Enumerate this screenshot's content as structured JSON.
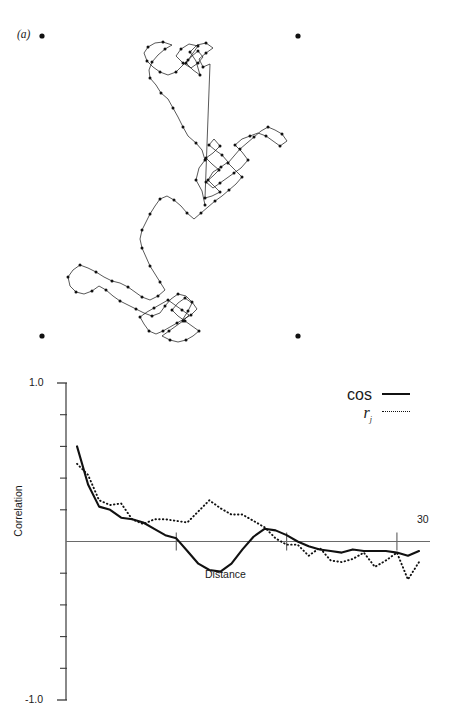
{
  "panels": {
    "a": {
      "label": "(a)"
    },
    "b": {
      "label": "(b)"
    }
  },
  "panel_a": {
    "name": "random-walk-trajectory",
    "corner_markers": [
      {
        "x": 42,
        "y": 36
      },
      {
        "x": 298,
        "y": 36
      },
      {
        "x": 42,
        "y": 336
      },
      {
        "x": 298,
        "y": 336
      }
    ],
    "marker_radius": 2.6,
    "vertex_radius": 1.5,
    "line_color": "#111111",
    "path": [
      [
        205,
        205
      ],
      [
        202,
        191
      ],
      [
        196,
        180
      ],
      [
        199,
        168
      ],
      [
        205,
        160
      ],
      [
        202,
        150
      ],
      [
        196,
        143
      ],
      [
        188,
        136
      ],
      [
        183,
        127
      ],
      [
        178,
        117
      ],
      [
        173,
        108
      ],
      [
        168,
        99
      ],
      [
        161,
        93
      ],
      [
        156,
        85
      ],
      [
        150,
        78
      ],
      [
        149,
        70
      ],
      [
        152,
        62
      ],
      [
        158,
        55
      ],
      [
        165,
        49
      ],
      [
        172,
        45
      ],
      [
        163,
        42
      ],
      [
        155,
        43
      ],
      [
        148,
        47
      ],
      [
        144,
        53
      ],
      [
        147,
        61
      ],
      [
        153,
        67
      ],
      [
        160,
        72
      ],
      [
        168,
        75
      ],
      [
        176,
        72
      ],
      [
        182,
        66
      ],
      [
        188,
        60
      ],
      [
        193,
        53
      ],
      [
        198,
        46
      ],
      [
        189,
        44
      ],
      [
        181,
        49
      ],
      [
        176,
        56
      ],
      [
        183,
        63
      ],
      [
        191,
        68
      ],
      [
        198,
        63
      ],
      [
        203,
        57
      ],
      [
        198,
        51
      ],
      [
        192,
        56
      ],
      [
        186,
        63
      ],
      [
        193,
        70
      ],
      [
        200,
        75
      ],
      [
        196,
        61
      ],
      [
        190,
        52
      ],
      [
        197,
        45
      ],
      [
        206,
        43
      ],
      [
        213,
        48
      ],
      [
        206,
        53
      ],
      [
        199,
        59
      ],
      [
        203,
        67
      ],
      [
        210,
        64
      ],
      [
        205,
        198
      ],
      [
        212,
        196
      ],
      [
        220,
        192
      ],
      [
        214,
        186
      ],
      [
        208,
        180
      ],
      [
        213,
        172
      ],
      [
        221,
        167
      ],
      [
        228,
        162
      ],
      [
        222,
        155
      ],
      [
        215,
        150
      ],
      [
        209,
        145
      ],
      [
        214,
        139
      ],
      [
        220,
        146
      ],
      [
        213,
        153
      ],
      [
        206,
        158
      ],
      [
        212,
        164
      ],
      [
        219,
        170
      ],
      [
        213,
        176
      ],
      [
        206,
        182
      ],
      [
        213,
        188
      ],
      [
        220,
        183
      ],
      [
        227,
        178
      ],
      [
        234,
        173
      ],
      [
        241,
        168
      ],
      [
        248,
        160
      ],
      [
        242,
        152
      ],
      [
        235,
        145
      ],
      [
        242,
        139
      ],
      [
        250,
        136
      ],
      [
        258,
        133
      ],
      [
        266,
        136
      ],
      [
        273,
        141
      ],
      [
        280,
        146
      ],
      [
        287,
        141
      ],
      [
        282,
        134
      ],
      [
        275,
        130
      ],
      [
        268,
        127
      ],
      [
        261,
        131
      ],
      [
        254,
        137
      ],
      [
        247,
        143
      ],
      [
        240,
        149
      ],
      [
        234,
        156
      ],
      [
        228,
        163
      ],
      [
        235,
        170
      ],
      [
        242,
        177
      ],
      [
        236,
        184
      ],
      [
        229,
        190
      ],
      [
        222,
        196
      ],
      [
        215,
        201
      ],
      [
        208,
        207
      ],
      [
        201,
        213
      ],
      [
        194,
        219
      ],
      [
        187,
        213
      ],
      [
        181,
        206
      ],
      [
        174,
        200
      ],
      [
        167,
        196
      ],
      [
        160,
        199
      ],
      [
        155,
        206
      ],
      [
        150,
        214
      ],
      [
        146,
        222
      ],
      [
        142,
        230
      ],
      [
        140,
        239
      ],
      [
        142,
        248
      ],
      [
        146,
        257
      ],
      [
        150,
        266
      ],
      [
        155,
        274
      ],
      [
        160,
        282
      ],
      [
        165,
        290
      ],
      [
        158,
        296
      ],
      [
        150,
        300
      ],
      [
        142,
        297
      ],
      [
        135,
        292
      ],
      [
        128,
        287
      ],
      [
        120,
        283
      ],
      [
        112,
        281
      ],
      [
        104,
        277
      ],
      [
        96,
        272
      ],
      [
        88,
        268
      ],
      [
        80,
        265
      ],
      [
        73,
        270
      ],
      [
        68,
        277
      ],
      [
        70,
        286
      ],
      [
        76,
        292
      ],
      [
        84,
        294
      ],
      [
        92,
        291
      ],
      [
        99,
        286
      ],
      [
        106,
        290
      ],
      [
        113,
        296
      ],
      [
        120,
        301
      ],
      [
        128,
        305
      ],
      [
        136,
        309
      ],
      [
        144,
        313
      ],
      [
        152,
        316
      ],
      [
        160,
        313
      ],
      [
        165,
        306
      ],
      [
        171,
        299
      ],
      [
        178,
        294
      ],
      [
        186,
        296
      ],
      [
        192,
        302
      ],
      [
        197,
        309
      ],
      [
        191,
        315
      ],
      [
        184,
        319
      ],
      [
        177,
        323
      ],
      [
        170,
        327
      ],
      [
        163,
        331
      ],
      [
        156,
        334
      ],
      [
        149,
        331
      ],
      [
        144,
        324
      ],
      [
        140,
        317
      ],
      [
        147,
        312
      ],
      [
        154,
        308
      ],
      [
        161,
        304
      ],
      [
        168,
        300
      ],
      [
        175,
        305
      ],
      [
        182,
        310
      ],
      [
        189,
        315
      ],
      [
        183,
        321
      ],
      [
        176,
        326
      ],
      [
        169,
        331
      ],
      [
        162,
        336
      ],
      [
        170,
        340
      ],
      [
        178,
        342
      ],
      [
        186,
        340
      ],
      [
        193,
        336
      ],
      [
        199,
        331
      ],
      [
        192,
        326
      ],
      [
        185,
        321
      ],
      [
        178,
        316
      ],
      [
        172,
        310
      ],
      [
        178,
        303
      ],
      [
        185,
        298
      ],
      [
        192,
        303
      ],
      [
        188,
        311
      ],
      [
        183,
        319
      ]
    ]
  },
  "chart_data": {
    "type": "line",
    "title": "",
    "xlabel": "Distance",
    "ylabel": "Correlation",
    "xlim": [
      0,
      33
    ],
    "ylim": [
      -1.0,
      1.0
    ],
    "y_tick_labels": [
      "1.0",
      "-1.0"
    ],
    "y_tick_values": [
      1.0,
      -1.0
    ],
    "y_minor_ticks": [
      0.8,
      0.6,
      0.4,
      0.2,
      0.0,
      -0.2,
      -0.4,
      -0.6,
      -0.8
    ],
    "x_tick_labels": [
      "30"
    ],
    "x_tick_values": [
      10,
      20,
      30
    ],
    "x_labeled_tick": 30,
    "grid": false,
    "zero_line": true,
    "legend_position": "top-right",
    "series": [
      {
        "name": "cos",
        "style": "solid",
        "color": "#111111",
        "x": [
          1,
          2,
          3,
          4,
          5,
          6,
          7,
          8,
          9,
          10,
          11,
          12,
          13,
          14,
          15,
          16,
          17,
          18,
          19,
          20,
          21,
          22,
          23,
          24,
          25,
          26,
          27,
          28,
          29,
          30,
          31,
          32
        ],
        "values": [
          0.6,
          0.36,
          0.22,
          0.2,
          0.15,
          0.14,
          0.12,
          0.08,
          0.04,
          0.02,
          -0.06,
          -0.14,
          -0.18,
          -0.19,
          -0.14,
          -0.05,
          0.03,
          0.08,
          0.07,
          0.04,
          0.0,
          -0.03,
          -0.05,
          -0.06,
          -0.07,
          -0.05,
          -0.06,
          -0.06,
          -0.06,
          -0.07,
          -0.09,
          -0.06
        ]
      },
      {
        "name": "rj",
        "style": "dotted",
        "color": "#111111",
        "x": [
          1,
          2,
          3,
          4,
          5,
          6,
          7,
          8,
          9,
          10,
          11,
          12,
          13,
          14,
          15,
          16,
          17,
          18,
          19,
          20,
          21,
          22,
          23,
          24,
          25,
          26,
          27,
          28,
          29,
          30,
          31,
          32
        ],
        "values": [
          0.49,
          0.42,
          0.26,
          0.23,
          0.24,
          0.14,
          0.11,
          0.14,
          0.14,
          0.13,
          0.12,
          0.19,
          0.26,
          0.21,
          0.17,
          0.17,
          0.13,
          0.09,
          0.02,
          -0.02,
          -0.02,
          -0.09,
          -0.04,
          -0.12,
          -0.13,
          -0.11,
          -0.07,
          -0.16,
          -0.12,
          -0.07,
          -0.24,
          -0.13
        ]
      }
    ],
    "legend": [
      {
        "label": "cos",
        "style": "solid"
      },
      {
        "label": "r",
        "sub": "j",
        "style": "dotted"
      }
    ]
  },
  "labels": {
    "y_top": "1.0",
    "y_bottom": "-1.0",
    "x_end": "30",
    "y_title": "Correlation",
    "x_title": "Distance",
    "legend_cos": "cos",
    "legend_rj": "r"
  }
}
